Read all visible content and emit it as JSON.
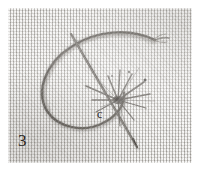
{
  "figure": {
    "number_label": "3",
    "annotation_label": "c",
    "medium": "halftone-printed photograph"
  },
  "plate": {
    "background_color": "#dcdad6",
    "weave_color": "#96938e",
    "margin_color": "#ffffff"
  },
  "elements": {
    "thread_loop_name": "thread-loop",
    "needle_name": "needle",
    "starburst_name": "radiating-stitch-burst",
    "thread_tail_name": "thread-tail",
    "canvas_name": "woven-canvas-ground"
  },
  "colors": {
    "thread": "#6e6a65",
    "thread_dark": "#4a4641",
    "needle": "#57534e",
    "label_text": "#2a2724"
  }
}
